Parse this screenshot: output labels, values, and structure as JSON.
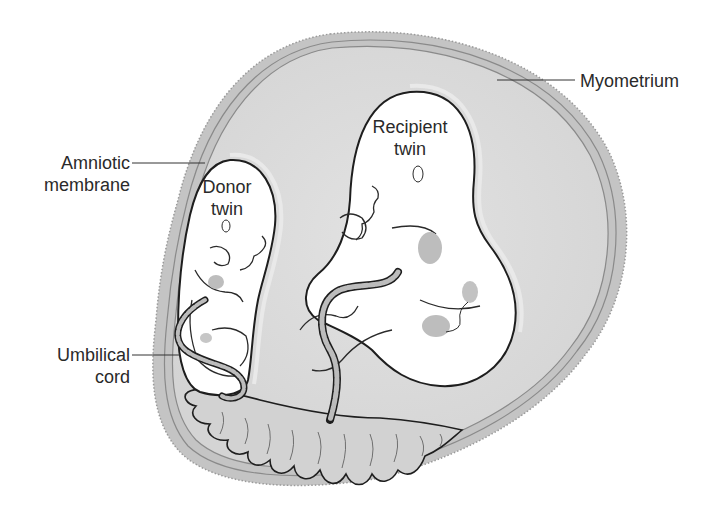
{
  "diagram": {
    "colors": {
      "myometrium": "#c4c4c4",
      "cavity": "#dadada",
      "sac_fill": "#ffffff",
      "outline": "#1e1e1e",
      "organ_shade": "#bdbdbd",
      "placenta": "#d2d2d2",
      "label_text": "#2a2a2a"
    }
  },
  "labels": {
    "myometrium": "Myometrium",
    "amniotic_membrane": [
      "Amniotic",
      "membrane"
    ],
    "donor_twin": [
      "Donor",
      "twin"
    ],
    "recipient_twin": [
      "Recipient",
      "twin"
    ],
    "umbilical_cord": [
      "Umbilical",
      "cord"
    ]
  }
}
